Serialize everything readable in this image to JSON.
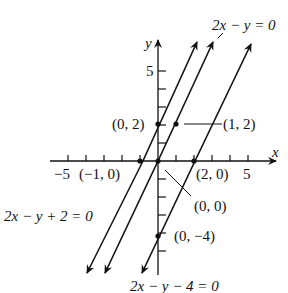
{
  "diagram": {
    "type": "coordinate-plane-lines",
    "axes": {
      "x_label": "x",
      "y_label": "y",
      "x_ticks": [
        -5,
        -4,
        -3,
        -2,
        -1,
        0,
        1,
        2,
        3,
        4,
        5
      ],
      "y_ticks": [
        -4,
        -3,
        -2,
        -1,
        0,
        1,
        2,
        3,
        4,
        5
      ],
      "x_tick_label_neg5": "−5",
      "x_tick_label_5": "5",
      "y_tick_label_5": "5"
    },
    "lines": [
      {
        "id": "line-a",
        "equation": "2x − y + 2 = 0",
        "slope": 2,
        "intercept": 2
      },
      {
        "id": "line-b",
        "equation": "2x − y = 0",
        "slope": 2,
        "intercept": 0
      },
      {
        "id": "line-c",
        "equation": "2x − y − 4 = 0",
        "slope": 2,
        "intercept": -4
      }
    ],
    "points": [
      {
        "label": "(0, 2)",
        "x": 0,
        "y": 2
      },
      {
        "label": "(1, 2)",
        "x": 1,
        "y": 2
      },
      {
        "label": "(−1, 0)",
        "x": -1,
        "y": 0
      },
      {
        "label": "(0, 0)",
        "x": 0,
        "y": 0
      },
      {
        "label": "(2, 0)",
        "x": 2,
        "y": 0
      },
      {
        "label": "(0, −4)",
        "x": 0,
        "y": -4
      }
    ],
    "colors": {
      "ink": "#111111",
      "background": "#ffffff"
    }
  }
}
